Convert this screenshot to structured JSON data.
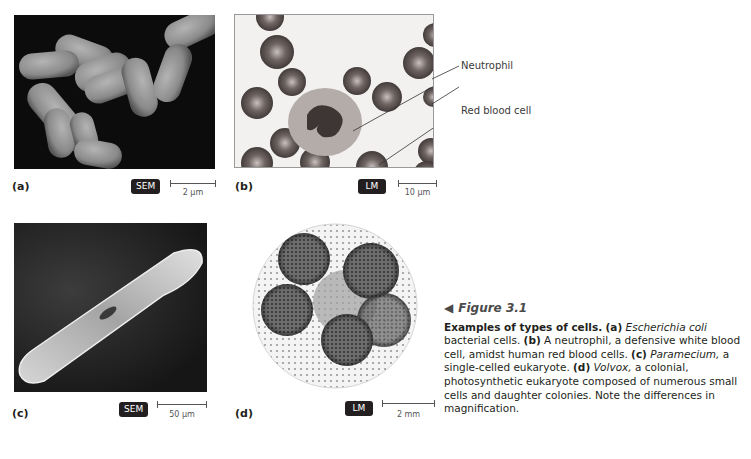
{
  "panels": [
    {
      "id": "a",
      "label": "(a)",
      "subject": "Escherichia coli bacterial cells",
      "microscope": "SEM",
      "scale": "2 µm"
    },
    {
      "id": "b",
      "label": "(b)",
      "subject": "neutrophil among red blood cells",
      "microscope": "LM",
      "scale": "10 µm",
      "callouts": [
        "Neutrophil",
        "Red blood cell"
      ]
    },
    {
      "id": "c",
      "label": "(c)",
      "subject": "Paramecium",
      "microscope": "SEM",
      "scale": "50 µm"
    },
    {
      "id": "d",
      "label": "(d)",
      "subject": "Volvox colony",
      "microscope": "LM",
      "scale": "2 mm"
    }
  ],
  "caption": {
    "arrow": "◀",
    "figure_title": "Figure 3.1",
    "bold_lead": "Examples of types of cells.",
    "a_tag": "(a)",
    "a_italic": "Escherichia coli",
    "a_text": " bacterial cells. ",
    "b_tag": "(b)",
    "b_text": " A neutrophil, a defensive white blood cell, amidst human red blood cells. ",
    "c_tag": "(c)",
    "c_italic": "Paramecium,",
    "c_text": " a single-celled eukaryote. ",
    "d_tag": "(d)",
    "d_italic": "Volvox,",
    "d_text": " a colonial, photosynthetic eukaryote composed of numerous small cells and daughter colonies. Note the differences in magnification."
  }
}
